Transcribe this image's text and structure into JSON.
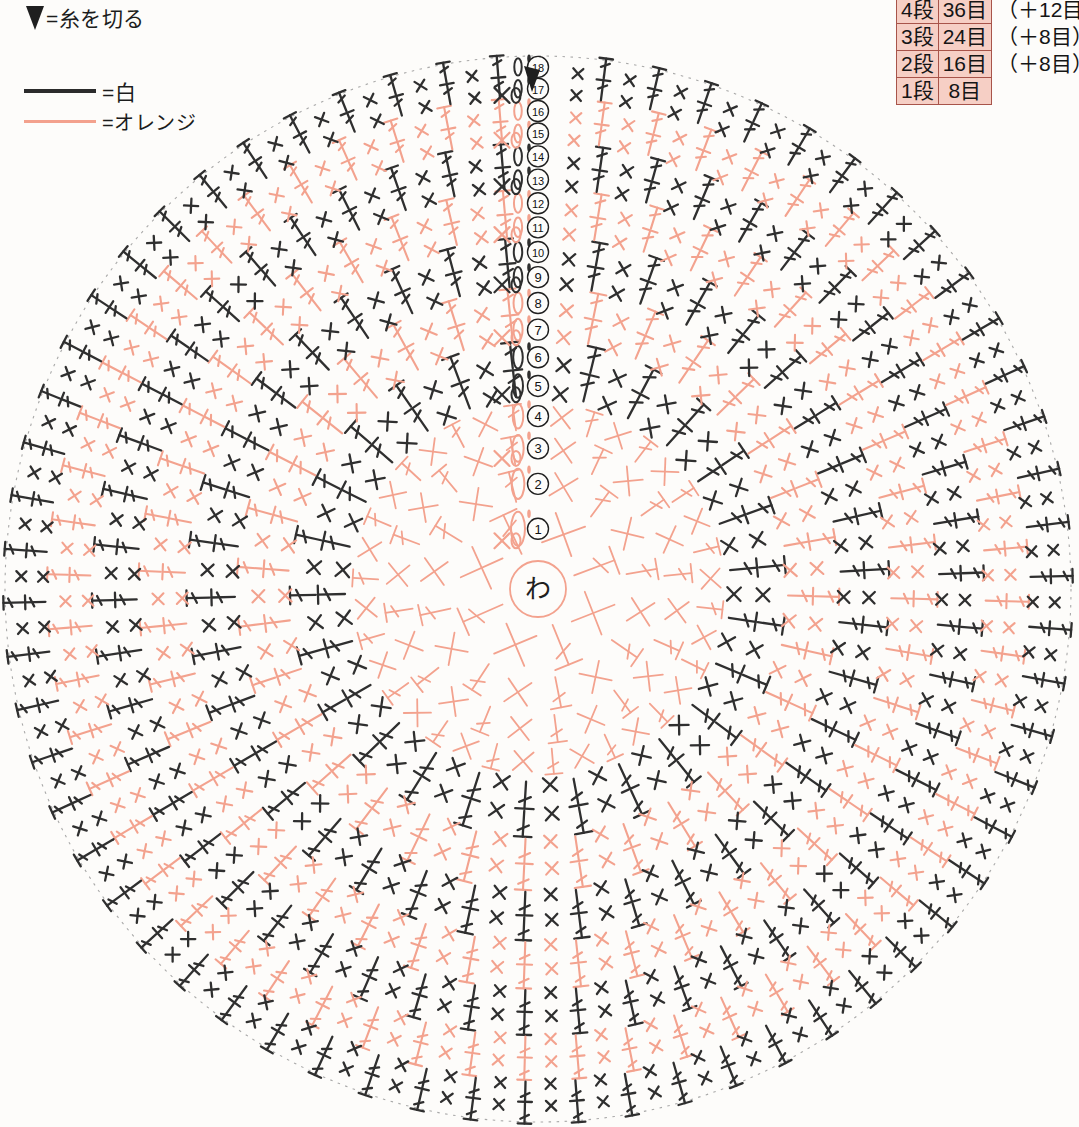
{
  "legend": {
    "cut_symbol": "triangle-down",
    "cut_label": "=糸を切る",
    "colors": [
      {
        "swatch": "black",
        "hex": "#2b2b2b",
        "label": "=白"
      },
      {
        "swatch": "orange",
        "hex": "#f3a18d",
        "label": "=オレンジ"
      }
    ]
  },
  "table": {
    "rows": [
      {
        "round": "5段",
        "count": "50目",
        "note": ""
      },
      {
        "round": "4段",
        "count": "36目",
        "note": "（＋12目）"
      },
      {
        "round": "3段",
        "count": "24目",
        "note": "（＋8目）"
      },
      {
        "round": "2段",
        "count": "16目",
        "note": "（＋8目）"
      },
      {
        "round": "1段",
        "count": "8目",
        "note": ""
      }
    ]
  },
  "chart": {
    "center_label": "わ",
    "round_labels": [
      "①",
      "②",
      "③",
      "④",
      "⑤",
      "⑥",
      "⑦",
      "⑧",
      "⑨",
      "⑩",
      "⑪",
      "⑫",
      "⑬",
      "⑭",
      "⑮",
      "⑯",
      "⑰",
      "⑱"
    ],
    "cut_marker": "▼",
    "colors": {
      "black": "#2f2f2f",
      "orange": "#f3a28e",
      "boundary": "#9a9a9a",
      "background": "#fdfcfa"
    },
    "geometry": {
      "center_x": 538,
      "center_y": 589,
      "outer_radius": 533,
      "rounds": 18
    },
    "round_colors": [
      "orange",
      "orange",
      "orange",
      "orange",
      "black",
      "black",
      "orange",
      "orange",
      "black",
      "black",
      "orange",
      "orange",
      "black",
      "black",
      "orange",
      "orange",
      "black",
      "black"
    ],
    "round_stitch_counts": [
      8,
      16,
      24,
      36,
      50,
      50,
      62,
      62,
      74,
      74,
      86,
      86,
      98,
      98,
      110,
      110,
      122,
      122
    ]
  }
}
